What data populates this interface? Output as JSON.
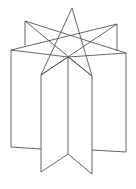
{
  "figure": {
    "stroke_color": "#555555",
    "background": "#ffffff",
    "star_points": [
      [
        72,
        8
      ],
      [
        117,
        24
      ],
      [
        126,
        53
      ],
      [
        92,
        76
      ],
      [
        41,
        75
      ],
      [
        11,
        50
      ],
      [
        25,
        21
      ]
    ],
    "center_vertex": [
      68,
      57
    ]
  }
}
